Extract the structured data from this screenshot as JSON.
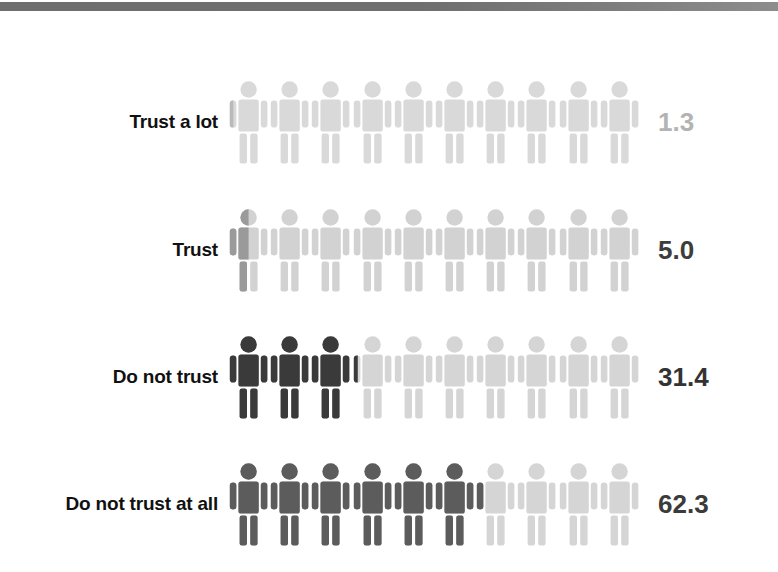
{
  "chart_data": {
    "type": "bar",
    "subtype": "pictogram",
    "title": "",
    "xlabel": "",
    "ylabel": "",
    "unit": "percent",
    "icons_per_row": 10,
    "percent_per_icon": 10,
    "categories": [
      "Trust a lot",
      "Trust",
      "Do not trust",
      "Do not trust at all"
    ],
    "values": [
      1.3,
      5.0,
      31.4,
      62.3
    ],
    "value_labels": [
      "1.3",
      "5.0",
      "31.4",
      "62.3"
    ],
    "series": [
      {
        "name": "Share of respondents (%)",
        "values": [
          1.3,
          5.0,
          31.4,
          62.3
        ]
      }
    ],
    "grid": false,
    "legend": false
  },
  "colors": {
    "background": "#ffffff",
    "top_rule": "#6e6e6e",
    "label_text": "#111111",
    "icon_empty": "#d5d5d5",
    "icon_empty_light": "#dcdcdc",
    "value_muted": "#b3b3b3",
    "value_dark": "#3a3a3a",
    "fill_row_1": "#b9b9b9",
    "fill_row_2": "#9a9a9a",
    "fill_row_3": "#3a3a3a",
    "fill_row_4": "#5c5c5c"
  },
  "rows": [
    {
      "id": "trust-a-lot",
      "label": "Trust a lot",
      "value": "1.3",
      "value_color": "#b3b3b3",
      "fill_color": "#b9b9b9",
      "empty_color": "#d9d9d9",
      "filled_icons": 0,
      "partial_fraction": 0.13,
      "top": 68
    },
    {
      "id": "trust",
      "label": "Trust",
      "value": "5.0",
      "value_color": "#3d3d3d",
      "fill_color": "#9a9a9a",
      "empty_color": "#d2d2d2",
      "filled_icons": 0,
      "partial_fraction": 0.5,
      "top": 196
    },
    {
      "id": "do-not-trust",
      "label": "Do not trust",
      "value": "31.4",
      "value_color": "#333333",
      "fill_color": "#3a3a3a",
      "empty_color": "#d5d5d5",
      "filled_icons": 3,
      "partial_fraction": 0.14,
      "top": 323
    },
    {
      "id": "do-not-trust-at-all",
      "label": "Do not trust at all",
      "value": "62.3",
      "value_color": "#3b3b3b",
      "fill_color": "#5c5c5c",
      "empty_color": "#d5d5d5",
      "filled_icons": 6,
      "partial_fraction": 0.23,
      "top": 450
    }
  ]
}
